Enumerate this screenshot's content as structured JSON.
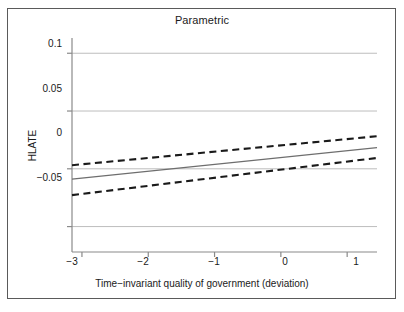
{
  "chart_data": {
    "type": "line",
    "title": "Parametric",
    "xlabel": "Time−invariant quality of government (deviation)",
    "ylabel": "HLATE",
    "xlim": [
      -3.15,
      1.45
    ],
    "ylim": [
      -0.072,
      0.108
    ],
    "xticks": [
      -3,
      -2,
      -1,
      0,
      1
    ],
    "xticklabels": [
      "−3",
      "−2",
      "−1",
      "0",
      "1"
    ],
    "yticks": [
      0.1,
      0.05,
      0,
      -0.05
    ],
    "yticklabels": [
      "0.1",
      "0.05",
      "0",
      "−0.05"
    ],
    "grid": "horizontal",
    "legend": "none",
    "series": [
      {
        "name": "Marginal effect (point estimate)",
        "style": "solid",
        "color": "#6e6e6e",
        "x": [
          -3.15,
          1.45
        ],
        "values": [
          -0.0089,
          0.0183
        ]
      },
      {
        "name": "Upper 95% confidence bound",
        "style": "dashed",
        "color": "#1a1a1a",
        "x": [
          -3.15,
          1.45
        ],
        "values": [
          0.0031,
          0.0282
        ]
      },
      {
        "name": "Lower 95% confidence bound",
        "style": "dashed",
        "color": "#1a1a1a",
        "x": [
          -3.15,
          1.45
        ],
        "values": [
          -0.0228,
          0.0094
        ]
      }
    ]
  },
  "colors": {
    "frame": "#5a5a5a",
    "axis": "#8a8a8a",
    "grid": "#bdbdbd",
    "estimate": "#6e6e6e",
    "bounds": "#1a1a1a",
    "text": "#1a1a1a",
    "background": "#ffffff"
  }
}
